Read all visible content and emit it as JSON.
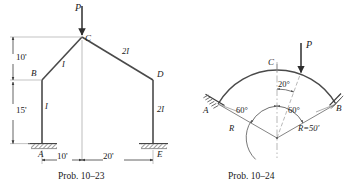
{
  "figure_left": {
    "caption": "Prob. 10–23",
    "load_label": "P",
    "points": {
      "a": "A",
      "b": "B",
      "c": "C",
      "d": "D",
      "e": "E"
    },
    "dimensions": {
      "upper_height": "10'",
      "lower_height": "15'",
      "left_span": "10'",
      "right_span": "20'"
    },
    "stiffness": {
      "left_column": "I",
      "left_rafter": "I",
      "right_rafter": "2I",
      "right_column": "2I"
    }
  },
  "figure_right": {
    "caption": "Prob. 10–24",
    "load_label": "P",
    "points": {
      "a": "A",
      "b": "B",
      "c": "C"
    },
    "angles": {
      "left": "60°",
      "right": "60°",
      "load_offset": "20°"
    },
    "radius_left": "R",
    "radius_right": "R=50'"
  },
  "colors": {
    "line": "#3c3c3c",
    "text": "#1a1a1a",
    "hatch": "#555555",
    "thin": "#808080"
  }
}
